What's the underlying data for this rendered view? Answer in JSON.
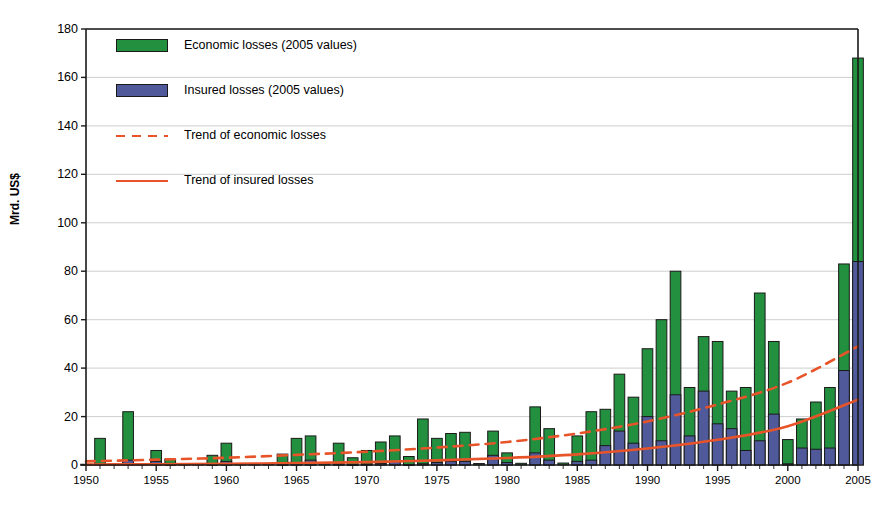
{
  "chart_data": {
    "type": "bar",
    "title": "",
    "subtitle": "",
    "xlabel": "",
    "ylabel": "Mrd. US$",
    "ylim": [
      0,
      180
    ],
    "ytick_step": 20,
    "yticks": [
      0,
      20,
      40,
      60,
      80,
      100,
      120,
      140,
      160,
      180
    ],
    "xlim": [
      1950,
      2005
    ],
    "xticks": [
      1950,
      1955,
      1960,
      1965,
      1970,
      1975,
      1980,
      1985,
      1990,
      1995,
      2000,
      2005
    ],
    "xtick_labels": [
      "1950",
      "1955",
      "1960",
      "1965",
      "1970",
      "1975",
      "1980",
      "1985",
      "1990",
      "1995",
      "2000",
      "2005"
    ],
    "grid": "horizontal",
    "stacked": true,
    "legend_position": "top-left",
    "colors": {
      "economic": "#22903e",
      "insured": "#505a9b",
      "trend": "#e8542a",
      "axis": "#1a1a1a",
      "grid": "#c8c8c8"
    },
    "categories": [
      1950,
      1951,
      1952,
      1953,
      1954,
      1955,
      1956,
      1957,
      1958,
      1959,
      1960,
      1961,
      1962,
      1963,
      1964,
      1965,
      1966,
      1967,
      1968,
      1969,
      1970,
      1971,
      1972,
      1973,
      1974,
      1975,
      1976,
      1977,
      1978,
      1979,
      1980,
      1981,
      1982,
      1983,
      1984,
      1985,
      1986,
      1987,
      1988,
      1989,
      1990,
      1991,
      1992,
      1993,
      1994,
      1995,
      1996,
      1997,
      1998,
      1999,
      2000,
      2001,
      2002,
      2003,
      2004,
      2005
    ],
    "series": [
      {
        "name": "Economic losses (2005 values)",
        "key": "economic",
        "color": "#22903e",
        "values": [
          0.3,
          11.0,
          0.4,
          22.0,
          0.5,
          6.0,
          2.5,
          0.4,
          0.5,
          4.0,
          9.0,
          0.5,
          0.4,
          0.5,
          4.5,
          11.0,
          12.0,
          0.6,
          9.0,
          3.0,
          6.0,
          9.5,
          12.0,
          3.5,
          19.0,
          11.0,
          13.0,
          13.5,
          0.6,
          14.0,
          5.0,
          0.7,
          24.0,
          15.0,
          0.8,
          12.0,
          22.0,
          23.0,
          37.5,
          28.0,
          48.0,
          60.0,
          80.0,
          32.0,
          53.0,
          51.0,
          30.5,
          32.0,
          71.0,
          51.0,
          10.5,
          19.0,
          26.0,
          32.0,
          83.0,
          168.0
        ]
      },
      {
        "name": "Insured losses (2005 values)",
        "key": "insured",
        "color": "#505a9b",
        "values": [
          0.0,
          0.4,
          0.0,
          2.0,
          0.0,
          1.5,
          0.2,
          0.0,
          0.0,
          0.3,
          1.5,
          0.0,
          0.0,
          0.0,
          0.3,
          1.0,
          2.0,
          0.0,
          0.5,
          0.2,
          0.4,
          0.6,
          1.5,
          0.2,
          0.5,
          1.0,
          1.5,
          1.5,
          0.0,
          4.0,
          1.0,
          0.0,
          5.0,
          2.0,
          0.0,
          1.5,
          2.0,
          8.0,
          14.0,
          9.0,
          20.0,
          10.0,
          29.0,
          12.0,
          30.5,
          17.0,
          15.0,
          6.0,
          10.0,
          21.0,
          0.5,
          7.0,
          6.5,
          7.0,
          39.0,
          84.0
        ]
      }
    ],
    "trend_lines": [
      {
        "name": "Trend of economic losses",
        "key": "trend_economic",
        "style": "dashed",
        "color": "#e8542a",
        "points": [
          {
            "x": 1950,
            "y": 1.5
          },
          {
            "x": 1955,
            "y": 2.2
          },
          {
            "x": 1960,
            "y": 3.0
          },
          {
            "x": 1965,
            "y": 4.2
          },
          {
            "x": 1970,
            "y": 5.5
          },
          {
            "x": 1975,
            "y": 7.2
          },
          {
            "x": 1980,
            "y": 9.5
          },
          {
            "x": 1985,
            "y": 13.0
          },
          {
            "x": 1990,
            "y": 18.0
          },
          {
            "x": 1995,
            "y": 25.0
          },
          {
            "x": 2000,
            "y": 34.0
          },
          {
            "x": 2005,
            "y": 49.0
          }
        ]
      },
      {
        "name": "Trend of insured losses",
        "key": "trend_insured",
        "style": "solid",
        "color": "#e8542a",
        "points": [
          {
            "x": 1950,
            "y": 0.2
          },
          {
            "x": 1955,
            "y": 0.3
          },
          {
            "x": 1960,
            "y": 0.5
          },
          {
            "x": 1965,
            "y": 0.8
          },
          {
            "x": 1970,
            "y": 1.2
          },
          {
            "x": 1975,
            "y": 1.9
          },
          {
            "x": 1980,
            "y": 2.9
          },
          {
            "x": 1985,
            "y": 4.4
          },
          {
            "x": 1990,
            "y": 6.8
          },
          {
            "x": 1995,
            "y": 10.4
          },
          {
            "x": 2000,
            "y": 16.0
          },
          {
            "x": 2005,
            "y": 27.0
          }
        ]
      }
    ],
    "legend": [
      {
        "label": "Economic losses (2005 values)",
        "marker": "swatch",
        "color": "#22903e"
      },
      {
        "label": "Insured losses (2005 values)",
        "marker": "swatch",
        "color": "#505a9b"
      },
      {
        "label": "Trend of economic losses",
        "marker": "dashed-line",
        "color": "#e8542a"
      },
      {
        "label": "Trend of insured losses",
        "marker": "solid-line",
        "color": "#e8542a"
      }
    ]
  }
}
